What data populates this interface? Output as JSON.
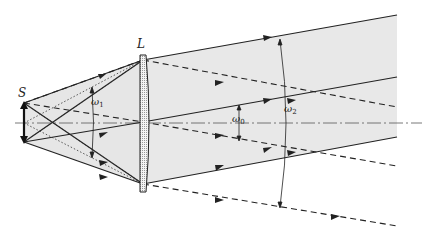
{
  "diagram": {
    "type": "optics-ray-diagram",
    "labels": {
      "source": "S",
      "lens": "L",
      "omega1": "ω",
      "omega1_sub": "1",
      "omega0": "ω",
      "omega0_sub": "0",
      "omega2": "ω",
      "omega2_sub": "2"
    },
    "colors": {
      "line": "#222222",
      "beam_fill": "#e6e6e6",
      "axis": "#555555"
    }
  }
}
